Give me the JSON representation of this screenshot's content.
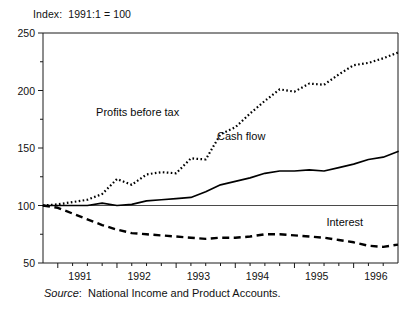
{
  "figure": {
    "index_note": "Index:  1991:1 = 100",
    "source_prefix": "Source",
    "source_colon": ":",
    "source_text": "National Income and Product Accounts."
  },
  "chart_data": {
    "type": "line",
    "title": "Index:  1991:1 = 100",
    "xlabel": "",
    "ylabel": "",
    "ylim": [
      50,
      250
    ],
    "xlim": [
      1990.75,
      1996.75
    ],
    "grid": false,
    "legend_position": "inline-annotations",
    "yticks": [
      50,
      100,
      150,
      200,
      250
    ],
    "ytick_labels": [
      "50",
      "100",
      "150",
      "200",
      "250"
    ],
    "yminor_ticks": [
      75,
      125,
      175,
      225
    ],
    "xticks": [
      1991,
      1992,
      1993,
      1994,
      1995,
      1996
    ],
    "xtick_labels": [
      "1991",
      "1992",
      "1993",
      "1994",
      "1995",
      "1996"
    ],
    "xminor_ticks": [
      1991.25,
      1991.5,
      1991.75,
      1992.25,
      1992.5,
      1992.75,
      1993.25,
      1993.5,
      1993.75,
      1994.25,
      1994.5,
      1994.75,
      1995.25,
      1995.5,
      1995.75,
      1996.25,
      1996.5
    ],
    "reference_line": {
      "value": 100,
      "label": "100 index baseline"
    },
    "x": [
      1990.75,
      1991.0,
      1991.25,
      1991.5,
      1991.75,
      1992.0,
      1992.25,
      1992.5,
      1992.75,
      1993.0,
      1993.25,
      1993.5,
      1993.75,
      1994.0,
      1994.25,
      1994.5,
      1994.75,
      1995.0,
      1995.25,
      1995.5,
      1995.75,
      1996.0,
      1996.25,
      1996.5,
      1996.75
    ],
    "series": [
      {
        "name": "Profits before tax",
        "style": "dotted",
        "color": "#000000",
        "label_position": {
          "x": 1992.35,
          "y": 178
        },
        "values": [
          100,
          101,
          103,
          105,
          110,
          123,
          118,
          127,
          129,
          128,
          141,
          140,
          162,
          168,
          180,
          191,
          201,
          199,
          206,
          205,
          214,
          222,
          224,
          228,
          233
        ]
      },
      {
        "name": "Cash flow",
        "style": "solid",
        "color": "#000000",
        "label_position": {
          "x": 1994.1,
          "y": 157
        },
        "values": [
          100,
          100,
          100,
          100,
          102,
          100,
          101,
          104,
          105,
          106,
          107,
          112,
          118,
          121,
          124,
          128,
          130,
          130,
          131,
          130,
          133,
          136,
          140,
          142,
          147
        ]
      },
      {
        "name": "Interest",
        "style": "dashed",
        "color": "#000000",
        "label_position": {
          "x": 1995.85,
          "y": 82
        },
        "values": [
          100,
          98,
          93,
          88,
          83,
          79,
          76,
          75,
          74,
          73,
          72,
          71,
          72,
          72,
          73,
          75,
          75,
          74,
          73,
          72,
          70,
          68,
          65,
          64,
          66
        ]
      }
    ]
  }
}
